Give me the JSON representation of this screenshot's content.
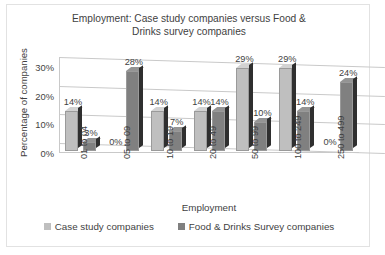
{
  "chart_data": {
    "type": "bar",
    "title": "Employment: Case study companies versus Food & Drinks survey companies",
    "title_line1": "Employment: Case study companies versus Food &",
    "title_line2": "Drinks survey companies",
    "xlabel": "Employment",
    "ylabel": "Percentage of companies",
    "ylim": [
      0,
      30
    ],
    "ytick_labels": [
      "0%",
      "10%",
      "20%",
      "30%"
    ],
    "ytick_values": [
      0,
      10,
      20,
      30
    ],
    "grid": true,
    "legend_position": "bottom",
    "categories": [
      "01 to 04",
      "05 to 09",
      "10 to 19",
      "20 to 49",
      "50 to 99",
      "100 to 249",
      "250 to 499"
    ],
    "series": [
      {
        "name": "Case study companies",
        "color": "#BFBFBF",
        "values": [
          14,
          0,
          14,
          14,
          29,
          29,
          0
        ],
        "data_labels": [
          "14%",
          "0%",
          "14%",
          "14%",
          "29%",
          "29%",
          "0%"
        ]
      },
      {
        "name": "Food & Drinks Survey companies",
        "color": "#808080",
        "values": [
          3,
          28,
          7,
          14,
          10,
          14,
          24
        ],
        "data_labels": [
          "3%",
          "28%",
          "7%",
          "14%",
          "10%",
          "14%",
          "24%"
        ]
      }
    ]
  }
}
